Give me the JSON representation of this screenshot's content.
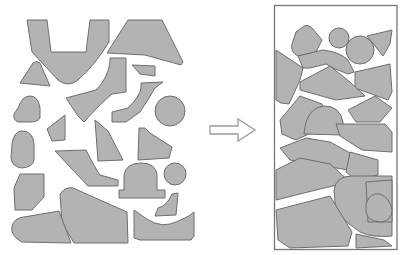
{
  "diagram": {
    "colors": {
      "background": "#ffffff",
      "piece_fill": "#b3b3b3",
      "piece_stroke": "#6e6e6e",
      "container_stroke": "#777777",
      "arrow_stroke": "#9a9a9a"
    },
    "left_panel": {
      "label": "input parts (unnested)",
      "piece_count": 22
    },
    "arrow": {
      "label": "transforms to",
      "direction": "right"
    },
    "right_panel": {
      "label": "nested layout in rectangular sheet",
      "piece_count": 22
    }
  }
}
